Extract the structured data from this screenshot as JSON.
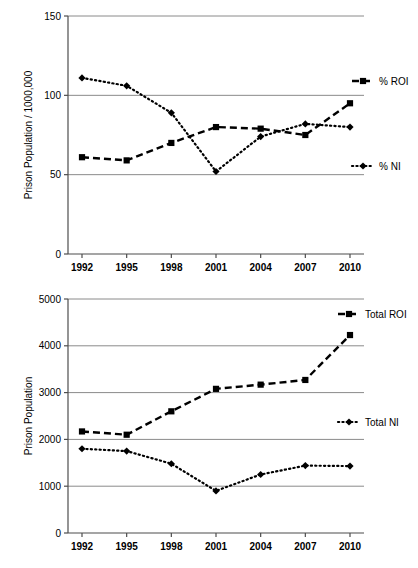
{
  "chart_data": [
    {
      "id": "rate-chart",
      "type": "line",
      "title": "",
      "xlabel": "",
      "ylabel": "Prison Population / 1000,000",
      "categories": [
        "1992",
        "1995",
        "1998",
        "2001",
        "2004",
        "2007",
        "2010"
      ],
      "ylim": [
        0,
        150
      ],
      "yticks": [
        0,
        50,
        100,
        150
      ],
      "ytick_labels": [
        "0",
        "50",
        "100",
        "150"
      ],
      "grid": true,
      "legend_position": "right",
      "series": [
        {
          "name": "% ROI",
          "marker": "square",
          "line_style": "dashed",
          "color": "#000000",
          "values": [
            61,
            59,
            70,
            80,
            79,
            75,
            95
          ]
        },
        {
          "name": "% NI",
          "marker": "diamond",
          "line_style": "dotted",
          "color": "#000000",
          "values": [
            111,
            106,
            89,
            52,
            74,
            82,
            80
          ]
        }
      ]
    },
    {
      "id": "total-chart",
      "type": "line",
      "title": "",
      "xlabel": "",
      "ylabel": "Prison Population",
      "categories": [
        "1992",
        "1995",
        "1998",
        "2001",
        "2004",
        "2007",
        "2010"
      ],
      "ylim": [
        0,
        5000
      ],
      "yticks": [
        0,
        1000,
        2000,
        3000,
        4000,
        5000
      ],
      "ytick_labels": [
        "0",
        "1000",
        "2000",
        "3000",
        "4000",
        "5000"
      ],
      "grid": true,
      "legend_position": "right",
      "series": [
        {
          "name": "Total ROI",
          "marker": "square",
          "line_style": "dashed",
          "color": "#000000",
          "values": [
            2170,
            2100,
            2600,
            3080,
            3170,
            3270,
            4230
          ]
        },
        {
          "name": "Total NI",
          "marker": "diamond",
          "line_style": "dotted",
          "color": "#000000",
          "values": [
            1800,
            1750,
            1480,
            900,
            1250,
            1440,
            1430
          ]
        }
      ]
    }
  ]
}
